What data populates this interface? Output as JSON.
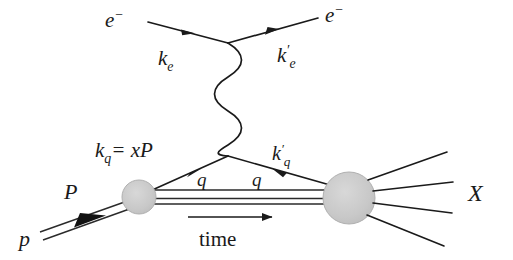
{
  "figure": {
    "background_color": "#ffffff",
    "line_color": "#1a1a1a",
    "blob_fill": "#c9c9c9",
    "blob_stroke": "#9a9a9a"
  },
  "labels": {
    "electron_in_symbol": "e",
    "electron_in_charge": "−",
    "electron_out_symbol": "e",
    "electron_out_charge": "−",
    "electron_in_momentum_base": "k",
    "electron_in_momentum_sub": "e",
    "electron_out_momentum_base": "k",
    "electron_out_momentum_prime": "′",
    "electron_out_momentum_sub": "e",
    "quark_in_momentum_base": "k",
    "quark_in_momentum_sub": "q",
    "quark_in_momentum_equals": "= xP",
    "quark_out_momentum_base": "k",
    "quark_out_momentum_prime": "′",
    "quark_out_momentum_sub": "q",
    "photon_q_left": "q",
    "photon_q_right": "q",
    "proton_momentum": "P",
    "proton_symbol": "p",
    "hadrons_symbol": "X",
    "time_label": "time"
  },
  "annotations": {
    "photon_oscillations": 4,
    "hadron_fan_count": 4,
    "spectator_line_count": 3
  },
  "geometry": {
    "electron_vertex": {
      "x": 228,
      "y": 43
    },
    "photon_lower_vertex": {
      "x": 228,
      "y": 156
    },
    "proton_blob": {
      "cx": 139,
      "cy": 197,
      "r": 17
    },
    "hadron_blob": {
      "cx": 349,
      "cy": 198,
      "r": 26
    },
    "time_arrow": {
      "x1": 188,
      "y1": 217,
      "x2": 276,
      "y2": 217
    }
  }
}
